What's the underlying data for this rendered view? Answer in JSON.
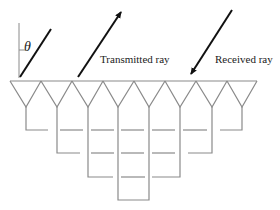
{
  "diagram": {
    "type": "phased-array-antenna-feed-network",
    "angle_symbol": "θ",
    "labels": {
      "transmitted": "Transmitted ray",
      "received": "Received ray"
    },
    "antenna_count": 8,
    "colors": {
      "rays": "#111111",
      "structure": "#8a8a8a",
      "text": "#222222",
      "background": "#ffffff"
    }
  }
}
